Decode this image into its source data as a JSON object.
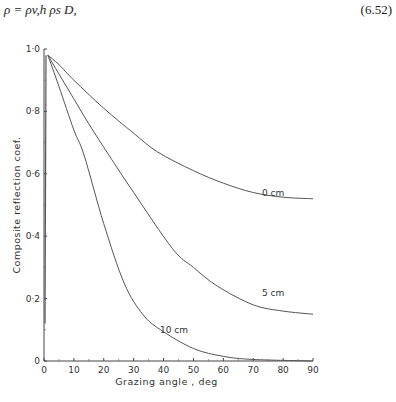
{
  "equation": {
    "text": "ρ = ρv,h ρs D,",
    "number": "(6.52)"
  },
  "chart_data": {
    "type": "line",
    "title": "",
    "xlabel": "Grazing angle , deg",
    "ylabel": "Composite reflection coef.",
    "xlim": [
      0,
      90
    ],
    "ylim": [
      0,
      1.0
    ],
    "x_ticks": [
      "0",
      "10",
      "20",
      "30",
      "40",
      "50",
      "60",
      "70",
      "80",
      "90"
    ],
    "y_ticks": [
      "0",
      "0·2",
      "0·4",
      "0·6",
      "0·8",
      "1·0"
    ],
    "grid": false,
    "legend": "inline curve labels",
    "series": [
      {
        "name": "0 cm",
        "x": [
          0,
          1.3,
          5,
          10,
          20,
          30,
          38,
          50,
          60,
          70,
          80,
          90
        ],
        "y": [
          0.12,
          0.98,
          0.95,
          0.9,
          0.81,
          0.73,
          0.67,
          0.61,
          0.57,
          0.54,
          0.525,
          0.52
        ]
      },
      {
        "name": "5 cm",
        "x": [
          0,
          1.3,
          5,
          10,
          15,
          21.7,
          30,
          43,
          50,
          58,
          70,
          80,
          90
        ],
        "y": [
          0.12,
          0.98,
          0.92,
          0.84,
          0.76,
          0.66,
          0.54,
          0.36,
          0.3,
          0.24,
          0.18,
          0.16,
          0.15
        ]
      },
      {
        "name": "10 cm",
        "x": [
          0,
          1.3,
          5,
          10,
          13.4,
          20,
          26.8,
          33,
          39,
          50,
          60,
          70,
          90
        ],
        "y": [
          0.12,
          0.98,
          0.88,
          0.74,
          0.66,
          0.44,
          0.25,
          0.15,
          0.1,
          0.04,
          0.015,
          0.005,
          0.0
        ]
      }
    ]
  }
}
